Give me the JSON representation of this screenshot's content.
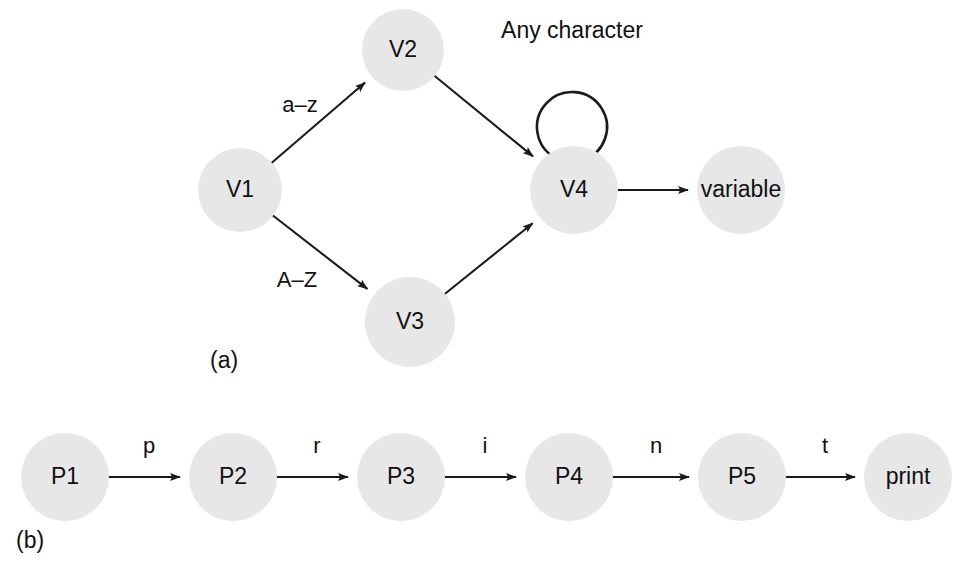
{
  "figure": {
    "background_color": "#ffffff",
    "node_fill_color": "#e7e7e7",
    "stroke_color": "#1b1b1b",
    "text_color": "#111111"
  },
  "panels": [
    {
      "id": "panel-a",
      "caption": "(a)",
      "caption_x": 210,
      "caption_y": 362,
      "nodes": [
        {
          "id": "V1",
          "label": "V1",
          "cx": 240,
          "cy": 190,
          "r": 42
        },
        {
          "id": "V2",
          "label": "V2",
          "cx": 403,
          "cy": 50,
          "r": 41
        },
        {
          "id": "V3",
          "label": "V3",
          "cx": 410,
          "cy": 322,
          "r": 45
        },
        {
          "id": "V4",
          "label": "V4",
          "cx": 574,
          "cy": 190,
          "r": 44
        },
        {
          "id": "variable",
          "label": "variable",
          "cx": 741,
          "cy": 190,
          "r": 44
        }
      ],
      "edges": [
        {
          "from": "V1",
          "to": "V2",
          "label": "a–z",
          "label_x": 300,
          "label_y": 106
        },
        {
          "from": "V1",
          "to": "V3",
          "label": "A–Z",
          "label_x": 297,
          "label_y": 281
        },
        {
          "from": "V2",
          "to": "V4",
          "label": "",
          "label_x": 0,
          "label_y": 0
        },
        {
          "from": "V3",
          "to": "V4",
          "label": "",
          "label_x": 0,
          "label_y": 0
        },
        {
          "from": "V4",
          "to": "variable",
          "label": "",
          "label_x": 0,
          "label_y": 0
        }
      ],
      "self_loops": [
        {
          "on": "V4",
          "label": "Any character",
          "label_x": 572,
          "label_y": 32
        }
      ]
    },
    {
      "id": "panel-b",
      "caption": "(b)",
      "caption_x": 16,
      "caption_y": 542,
      "nodes": [
        {
          "id": "P1",
          "label": "P1",
          "cx": 65,
          "cy": 477,
          "r": 44
        },
        {
          "id": "P2",
          "label": "P2",
          "cx": 233,
          "cy": 477,
          "r": 44
        },
        {
          "id": "P3",
          "label": "P3",
          "cx": 401,
          "cy": 477,
          "r": 44
        },
        {
          "id": "P4",
          "label": "P4",
          "cx": 569,
          "cy": 477,
          "r": 44
        },
        {
          "id": "P5",
          "label": "P5",
          "cx": 742,
          "cy": 477,
          "r": 44
        },
        {
          "id": "print",
          "label": "print",
          "cx": 908,
          "cy": 477,
          "r": 44
        }
      ],
      "edges": [
        {
          "from": "P1",
          "to": "P2",
          "label": "p",
          "label_x": 149,
          "label_y": 447
        },
        {
          "from": "P2",
          "to": "P3",
          "label": "r",
          "label_x": 317,
          "label_y": 447
        },
        {
          "from": "P3",
          "to": "P4",
          "label": "i",
          "label_x": 485,
          "label_y": 447
        },
        {
          "from": "P4",
          "to": "P5",
          "label": "n",
          "label_x": 656,
          "label_y": 447
        },
        {
          "from": "P5",
          "to": "print",
          "label": "t",
          "label_x": 825,
          "label_y": 447
        }
      ],
      "self_loops": []
    }
  ]
}
